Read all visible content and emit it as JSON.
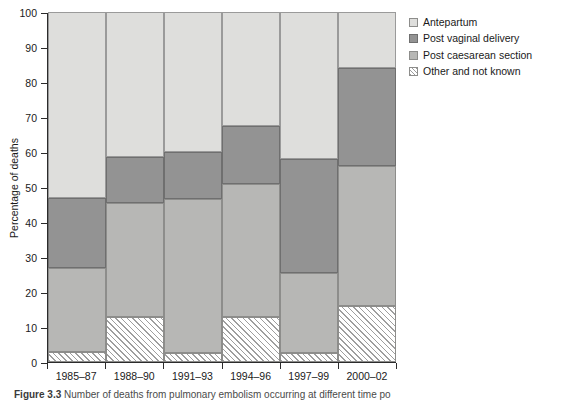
{
  "figure": {
    "caption_label": "Figure 3.3",
    "caption_text": "Number of deaths from pulmonary embolism occurring at different time po"
  },
  "chart_data": {
    "type": "bar",
    "stacked": true,
    "title": "",
    "xlabel": "",
    "ylabel": "Percentage of deaths",
    "ylim": [
      0,
      100
    ],
    "ytick_step": 10,
    "yticks": [
      0,
      10,
      20,
      30,
      40,
      50,
      60,
      70,
      80,
      90,
      100
    ],
    "grid": false,
    "legend_position": "right",
    "categories": [
      "1985–87",
      "1988–90",
      "1991–93",
      "1994–96",
      "1997–99",
      "2000–02"
    ],
    "series": [
      {
        "name": "Other and not known",
        "key": "other",
        "color": "#ffffff",
        "pattern": "diagonal-hatch",
        "values": [
          3.0,
          13.0,
          2.5,
          13.0,
          2.5,
          16.0
        ]
      },
      {
        "name": "Post caesarean section",
        "key": "pcs",
        "color": "#b7b7b5",
        "pattern": "solid",
        "values": [
          24.0,
          32.5,
          44.0,
          38.0,
          23.0,
          40.0
        ]
      },
      {
        "name": "Post vaginal delivery",
        "key": "pvd",
        "color": "#939393",
        "pattern": "solid",
        "values": [
          20.0,
          13.0,
          13.5,
          16.5,
          32.5,
          28.0
        ]
      },
      {
        "name": "Antepartum",
        "key": "ante",
        "color": "#dededc",
        "pattern": "solid",
        "values": [
          53.0,
          41.5,
          40.0,
          32.5,
          42.0,
          16.0
        ]
      }
    ],
    "cumulative_tops": {
      "other": [
        3.0,
        13.0,
        2.5,
        13.0,
        2.5,
        16.0
      ],
      "pcs": [
        27.0,
        45.5,
        46.5,
        51.0,
        25.5,
        56.0
      ],
      "pvd": [
        47.0,
        58.5,
        60.0,
        67.5,
        58.0,
        84.0
      ],
      "ante": [
        100,
        100,
        100,
        100,
        100,
        100
      ]
    }
  },
  "legend": {
    "items": [
      {
        "label": "Antepartum",
        "key": "ante"
      },
      {
        "label": "Post vaginal delivery",
        "key": "pvd"
      },
      {
        "label": "Post caesarean section",
        "key": "pcs"
      },
      {
        "label": "Other and not known",
        "key": "other"
      }
    ]
  }
}
